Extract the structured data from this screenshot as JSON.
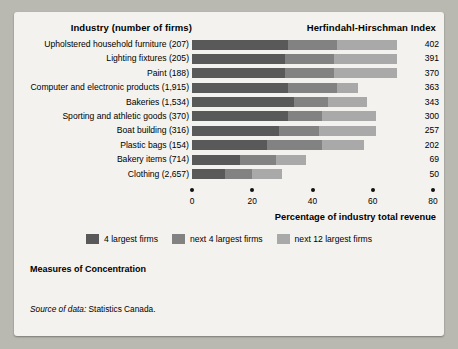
{
  "header": {
    "left_title": "Industry (number of firms)",
    "right_title": "Herfindahl-Hirschman Index"
  },
  "axis": {
    "title": "Percentage of industry total revenue",
    "ticks": [
      "0",
      "20",
      "40",
      "60",
      "80"
    ]
  },
  "legend": [
    {
      "label": "4 largest firms",
      "color": "#595959"
    },
    {
      "label": "next 4 largest firms",
      "color": "#828282"
    },
    {
      "label": "next 12 largest firms",
      "color": "#a9a9a9"
    }
  ],
  "footer": {
    "measures": "Measures of Concentration",
    "source_label": "Source of data:",
    "source_value": " Statistics Canada."
  },
  "chart_data": {
    "type": "bar",
    "orientation": "horizontal",
    "stacked": true,
    "title": "Industry (number of firms)",
    "xlabel": "Percentage of industry total revenue",
    "ylabel": "",
    "xlim": [
      0,
      80
    ],
    "grid": false,
    "legend_position": "bottom",
    "value_axis_label": "Herfindahl-Hirschman Index",
    "categories": [
      "Upholstered household furniture (207)",
      "Lighting fixtures (205)",
      "Paint (188)",
      "Computer and electronic products (1,915)",
      "Bakeries (1,534)",
      "Sporting and athletic goods (370)",
      "Boat building (316)",
      "Plastic bags (154)",
      "Bakery items (714)",
      "Clothing (2,657)"
    ],
    "series": [
      {
        "name": "4 largest firms",
        "values": [
          32,
          31,
          31,
          32,
          34,
          32,
          29,
          25,
          16,
          11
        ]
      },
      {
        "name": "next 4 largest firms",
        "values": [
          16,
          16,
          16,
          16,
          11,
          11,
          13,
          18,
          12,
          9
        ]
      },
      {
        "name": "next 12 largest firms",
        "values": [
          20,
          21,
          21,
          7,
          13,
          18,
          19,
          14,
          10,
          10
        ]
      }
    ],
    "hhi_values": [
      402,
      391,
      370,
      363,
      343,
      300,
      257,
      202,
      69,
      50
    ],
    "rows": [
      {
        "label": "Upholstered household furniture (207)",
        "s1": 32,
        "s2": 16,
        "s3": 20,
        "hhi": "402"
      },
      {
        "label": "Lighting fixtures (205)",
        "s1": 31,
        "s2": 16,
        "s3": 21,
        "hhi": "391"
      },
      {
        "label": "Paint (188)",
        "s1": 31,
        "s2": 16,
        "s3": 21,
        "hhi": "370"
      },
      {
        "label": "Computer and electronic products (1,915)",
        "s1": 32,
        "s2": 16,
        "s3": 7,
        "hhi": "363"
      },
      {
        "label": "Bakeries (1,534)",
        "s1": 34,
        "s2": 11,
        "s3": 13,
        "hhi": "343"
      },
      {
        "label": "Sporting and athletic goods (370)",
        "s1": 32,
        "s2": 11,
        "s3": 18,
        "hhi": "300"
      },
      {
        "label": "Boat building (316)",
        "s1": 29,
        "s2": 13,
        "s3": 19,
        "hhi": "257"
      },
      {
        "label": "Plastic bags (154)",
        "s1": 25,
        "s2": 18,
        "s3": 14,
        "hhi": "202"
      },
      {
        "label": "Bakery items (714)",
        "s1": 16,
        "s2": 12,
        "s3": 10,
        "hhi": "69"
      },
      {
        "label": "Clothing (2,657)",
        "s1": 11,
        "s2": 9,
        "s3": 10,
        "hhi": "50"
      }
    ]
  }
}
